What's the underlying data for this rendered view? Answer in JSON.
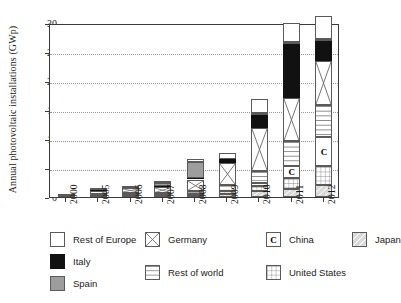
{
  "chart_data": {
    "type": "bar",
    "stacked": true,
    "title": "",
    "xlabel": "",
    "ylabel": "Annual photovoltaic installations (GWp)",
    "ylim": [
      0,
      30
    ],
    "yticks": [
      0,
      5,
      10,
      15,
      20,
      25,
      30
    ],
    "grid": "horizontal-dotted",
    "legend_position": "below",
    "categories": [
      "2000",
      "2005",
      "2006",
      "2007",
      "2008",
      "2009",
      "2010",
      "2011",
      "2012"
    ],
    "series": [
      {
        "name": "Japan",
        "pattern": "diagonal-hatch",
        "color": "#d9d9d9",
        "values": [
          0.12,
          0.29,
          0.29,
          0.21,
          0.23,
          0.48,
          0.99,
          1.3,
          2.0
        ]
      },
      {
        "name": "United States",
        "pattern": "grid",
        "color": "#ffffff",
        "values": [
          0.02,
          0.1,
          0.15,
          0.21,
          0.34,
          0.48,
          0.89,
          1.9,
          3.3
        ]
      },
      {
        "name": "China",
        "pattern": "letter-C",
        "color": "#ffffff",
        "values": [
          0.0,
          0.01,
          0.01,
          0.02,
          0.05,
          0.16,
          0.6,
          2.2,
          5.0
        ]
      },
      {
        "name": "Rest of world",
        "pattern": "horizontal-lines",
        "color": "#ffffff",
        "values": [
          0.04,
          0.12,
          0.18,
          0.25,
          0.45,
          0.9,
          2.0,
          4.2,
          5.6
        ]
      },
      {
        "name": "Germany",
        "pattern": "cross-box",
        "color": "#ffffff",
        "values": [
          0.04,
          0.6,
          0.85,
          1.1,
          1.95,
          3.8,
          7.4,
          7.5,
          7.6
        ]
      },
      {
        "name": "Italy",
        "pattern": "solid-black",
        "color": "#111111",
        "values": [
          0.0,
          0.01,
          0.01,
          0.07,
          0.34,
          0.72,
          2.3,
          9.3,
          3.4
        ]
      },
      {
        "name": "Spain",
        "pattern": "solid-gray",
        "color": "#9d9d9d",
        "values": [
          0.0,
          0.02,
          0.1,
          0.56,
          2.7,
          0.07,
          0.39,
          0.4,
          0.28
        ]
      },
      {
        "name": "Rest of Europe",
        "pattern": "white-empty",
        "color": "#ffffff",
        "values": [
          0.01,
          0.15,
          0.2,
          0.3,
          0.45,
          0.9,
          2.4,
          3.2,
          4.0
        ]
      }
    ],
    "totals": [
      0.23,
      1.3,
      1.79,
      2.72,
      6.51,
      7.51,
      17.0,
      30.0,
      31.18
    ],
    "annotations": [
      {
        "text": "C",
        "bar": "2010",
        "meaning": "China segment label"
      },
      {
        "text": "C",
        "bar": "2011",
        "meaning": "China segment label"
      },
      {
        "text": "C",
        "bar": "2012",
        "meaning": "China segment label"
      }
    ]
  },
  "axis": {
    "ylabel": "Annual photovoltaic installations (GWp)",
    "yticks": [
      "0",
      "5",
      "10",
      "15",
      "20",
      "25",
      "30"
    ],
    "xticks": [
      "2000",
      "2005",
      "2006",
      "2007",
      "2008",
      "2009",
      "2010",
      "2011",
      "2012"
    ]
  },
  "legend": {
    "items": [
      {
        "label": "Rest of Europe",
        "swatch": "white-empty-swatch"
      },
      {
        "label": "Italy",
        "swatch": "solid-black-swatch"
      },
      {
        "label": "Spain",
        "swatch": "solid-gray-swatch"
      },
      {
        "label": "Germany",
        "swatch": "cross-box-swatch"
      },
      {
        "label": "Rest of world",
        "swatch": "horizontal-lines-swatch"
      },
      {
        "label": "China",
        "swatch": "letter-c-swatch"
      },
      {
        "label": "United States",
        "swatch": "grid-swatch"
      },
      {
        "label": "Japan",
        "swatch": "diagonal-hatch-swatch"
      }
    ],
    "china_glyph": "C"
  },
  "colors": {
    "axis": "#3a3a3a",
    "grid": "#9a9a9a",
    "italy": "#111111",
    "spain": "#9d9d9d",
    "japan": "#d9d9d9",
    "background": "#ffffff"
  }
}
